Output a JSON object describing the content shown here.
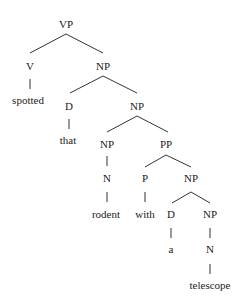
{
  "diagram": {
    "type": "syntax-tree",
    "nodes": {
      "vp": "VP",
      "v": "V",
      "spotted": "spotted",
      "np1": "NP",
      "d1": "D",
      "that": "that",
      "np2": "NP",
      "np3": "NP",
      "n1": "N",
      "rodent": "rodent",
      "pp": "PP",
      "p": "P",
      "with": "with",
      "np4": "NP",
      "d2": "D",
      "a": "a",
      "np5": "NP",
      "n2": "N",
      "telescope": "telescope"
    },
    "colors": {
      "text": "#222222",
      "line": "#333333",
      "background": "#ffffff"
    }
  }
}
